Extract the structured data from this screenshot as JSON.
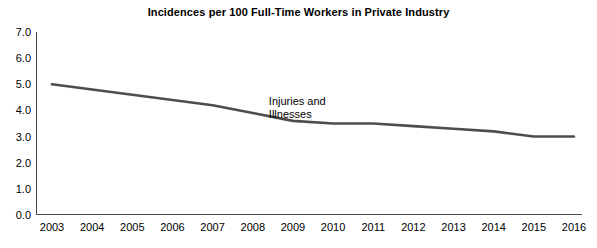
{
  "chart_data": {
    "type": "line",
    "title": "Incidences per 100 Full-Time Workers in Private Industry",
    "xlabel": "",
    "ylabel": "",
    "ylim": [
      0.0,
      7.0
    ],
    "ytick_labels": [
      "0.0",
      "1.0",
      "2.0",
      "3.0",
      "4.0",
      "5.0",
      "6.0",
      "7.0"
    ],
    "ytick_values": [
      0.0,
      1.0,
      2.0,
      3.0,
      4.0,
      5.0,
      6.0,
      7.0
    ],
    "grid": false,
    "legend": "none",
    "categories": [
      "2003",
      "2004",
      "2005",
      "2006",
      "2007",
      "2008",
      "2009",
      "2010",
      "2011",
      "2012",
      "2013",
      "2014",
      "2015",
      "2016"
    ],
    "x": [
      2003,
      2004,
      2005,
      2006,
      2007,
      2008,
      2009,
      2010,
      2011,
      2012,
      2013,
      2014,
      2015,
      2016
    ],
    "series": [
      {
        "name": "Injuries and Illnesses",
        "color": "#4d4d4d",
        "values": [
          5.0,
          4.8,
          4.6,
          4.4,
          4.2,
          3.9,
          3.6,
          3.5,
          3.5,
          3.4,
          3.3,
          3.2,
          3.0,
          3.0
        ]
      }
    ],
    "annotations": [
      {
        "name": "series-label",
        "text": "Injuries and\nIllnesses",
        "x": 2008.4,
        "y": 4.35
      }
    ]
  }
}
